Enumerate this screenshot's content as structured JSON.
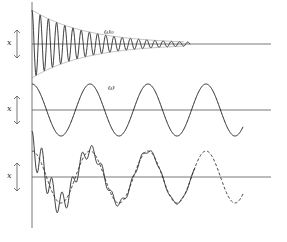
{
  "figure": {
    "stroke_color": "#2a2a2a",
    "axis_color": "#555555",
    "panels": [
      {
        "id": "free",
        "axis_label": "x",
        "curve_label": "ω₀",
        "baseline_y": 44,
        "curve": "damped oscillation at natural frequency ω₀, decaying to zero"
      },
      {
        "id": "forced",
        "axis_label": "x",
        "curve_label": "ω",
        "baseline_y": 110,
        "curve": "steady sinusoid at driving frequency ω"
      },
      {
        "id": "sum",
        "axis_label": "x",
        "curve_label": "",
        "baseline_y": 177,
        "curve": "superposition (solid) merging into steady state (dashed)"
      }
    ]
  }
}
